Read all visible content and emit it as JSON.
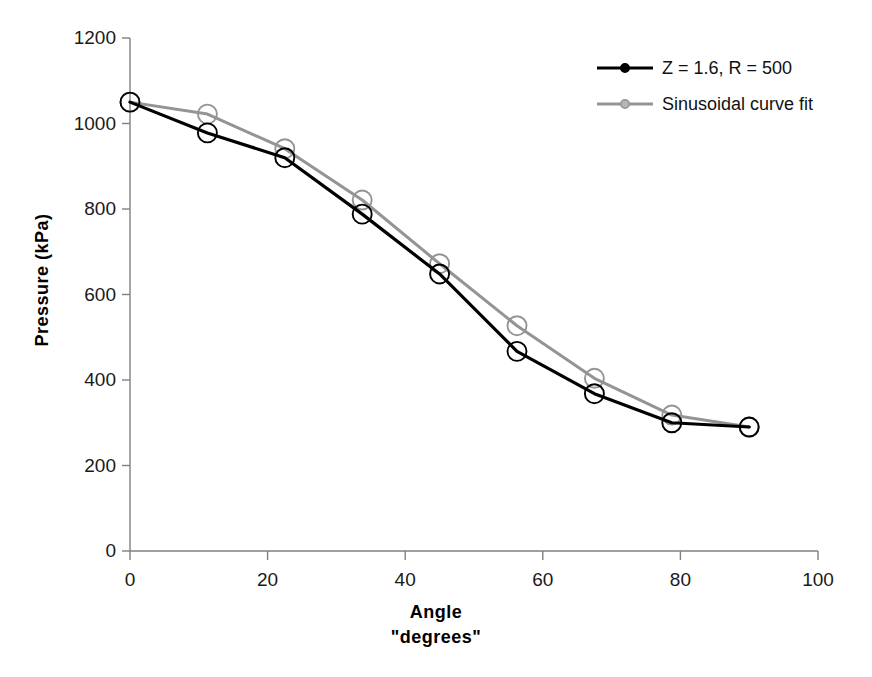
{
  "chart_data": {
    "type": "line",
    "title": "",
    "xlabel": "Angle",
    "xlabel_line2": "\"degrees\"",
    "ylabel": "Pressure (kPa)",
    "xlim": [
      0,
      100
    ],
    "ylim": [
      0,
      1200
    ],
    "xticks": [
      0,
      20,
      40,
      60,
      80,
      100
    ],
    "yticks": [
      0,
      200,
      400,
      600,
      800,
      1000,
      1200
    ],
    "xtick_labels": [
      "0",
      "20",
      "40",
      "60",
      "80",
      "100"
    ],
    "ytick_labels": [
      "0",
      "200",
      "400",
      "600",
      "800",
      "1000",
      "1200"
    ],
    "grid": false,
    "legend_position": "top-right",
    "x": [
      0,
      11.25,
      22.5,
      33.75,
      45,
      56.25,
      67.5,
      78.75,
      90
    ],
    "series": [
      {
        "name": "Z = 1.6, R = 500",
        "color": "#000000",
        "marker": "open-circle",
        "values": [
          1050,
          978,
          920,
          788,
          648,
          467,
          368,
          300,
          290
        ]
      },
      {
        "name": "Sinusoidal curve fit",
        "color": "#949494",
        "marker": "open-circle",
        "values": [
          1050,
          1022,
          941,
          821,
          672,
          527,
          404,
          318,
          290
        ]
      }
    ]
  },
  "legend": {
    "items": [
      {
        "label": "Z = 1.6, R = 500",
        "color": "#000000"
      },
      {
        "label": "Sinusoidal curve fit",
        "color": "#949494"
      }
    ]
  },
  "axes": {
    "x_title": "Angle",
    "x_title_line2": "\"degrees\"",
    "y_title": "Pressure (kPa)"
  },
  "colors": {
    "series_primary": "#000000",
    "series_secondary": "#949494",
    "axis": "#808080",
    "text": "#111111"
  }
}
